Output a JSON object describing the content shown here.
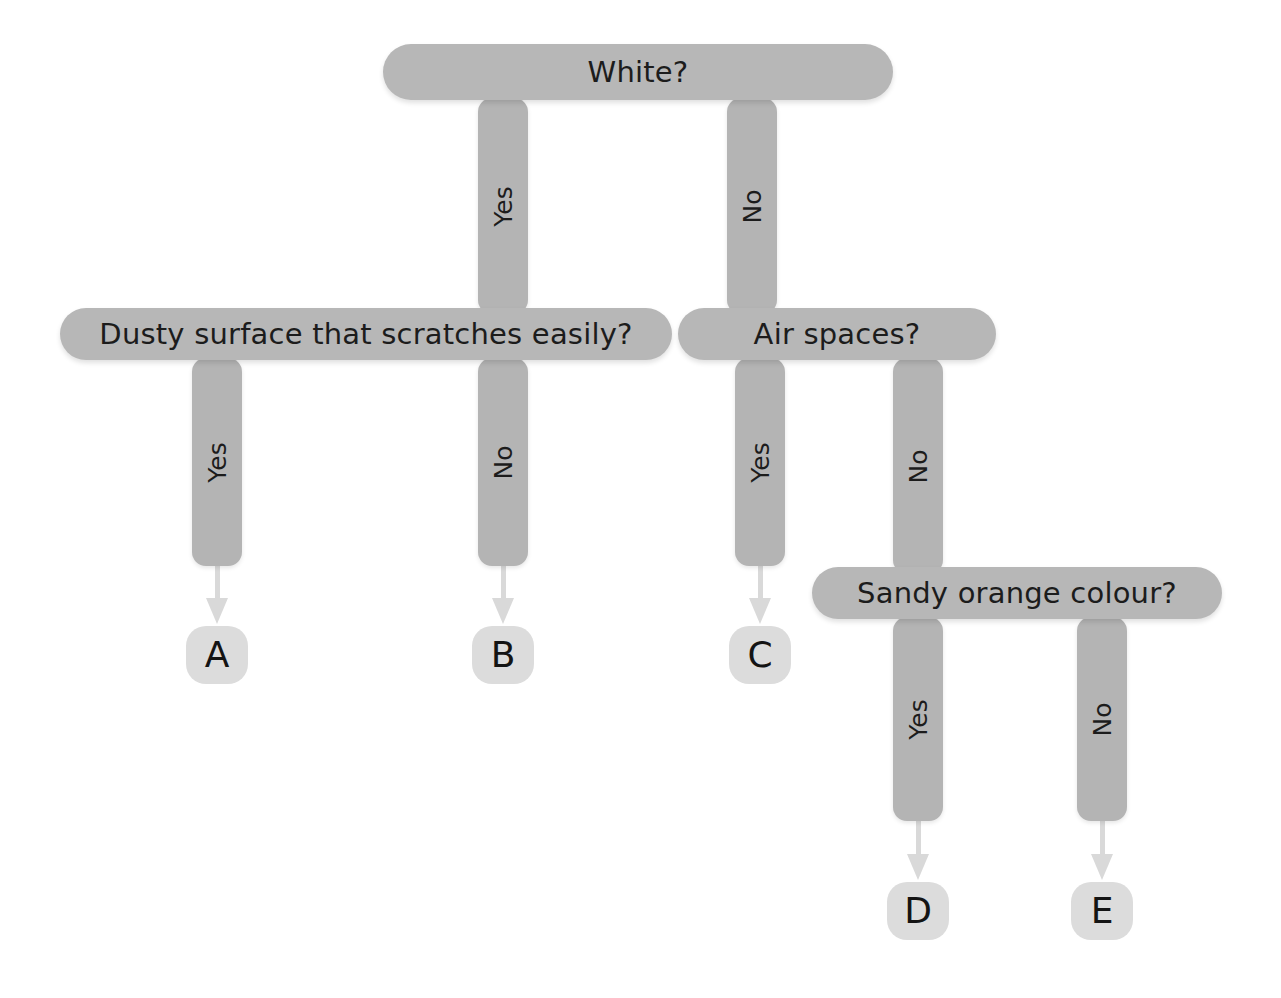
{
  "diagram": {
    "type": "decision-tree",
    "colors": {
      "question_bar": "#b7b7b7",
      "connector_bar": "#b4b4b4",
      "terminal_node": "#dcdcdc",
      "arrow": "#d9d9d9",
      "text": "#1c1c1c",
      "background": "#ffffff"
    }
  },
  "questions": [
    {
      "id": "q1",
      "text": "White?"
    },
    {
      "id": "q2",
      "text": "Dusty surface that scratches easily?"
    },
    {
      "id": "q3",
      "text": "Air spaces?"
    },
    {
      "id": "q4",
      "text": "Sandy orange colour?"
    }
  ],
  "connectors": [
    {
      "id": "c1",
      "label": "Yes",
      "from": "q1",
      "to": "q2"
    },
    {
      "id": "c2",
      "label": "No",
      "from": "q1",
      "to": "q3"
    },
    {
      "id": "c3",
      "label": "Yes",
      "from": "q2",
      "to": "A"
    },
    {
      "id": "c4",
      "label": "No",
      "from": "q2",
      "to": "B"
    },
    {
      "id": "c5",
      "label": "Yes",
      "from": "q3",
      "to": "C"
    },
    {
      "id": "c6",
      "label": "No",
      "from": "q3",
      "to": "q4"
    },
    {
      "id": "c7",
      "label": "Yes",
      "from": "q4",
      "to": "D"
    },
    {
      "id": "c8",
      "label": "No",
      "from": "q4",
      "to": "E"
    }
  ],
  "terminals": [
    {
      "id": "A",
      "label": "A"
    },
    {
      "id": "B",
      "label": "B"
    },
    {
      "id": "C",
      "label": "C"
    },
    {
      "id": "D",
      "label": "D"
    },
    {
      "id": "E",
      "label": "E"
    }
  ]
}
